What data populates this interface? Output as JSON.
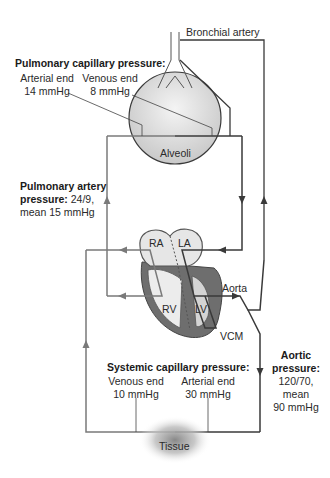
{
  "labels": {
    "bronchial_artery": "Bronchial artery",
    "pulmonary_capillary": {
      "title": "Pulmonary capillary pressure:",
      "arterial_end": "Arterial end",
      "arterial_value": "14 mmHg",
      "venous_end": "Venous end",
      "venous_value": "8 mmHg"
    },
    "alveoli": "Alveoli",
    "pulmonary_artery": {
      "title_line1": "Pulmonary artery",
      "title_line2_bold": "pressure:",
      "title_line2_rest": " 24/9,",
      "line3": "mean 15 mmHg"
    },
    "heart": {
      "ra": "RA",
      "la": "LA",
      "rv": "RV",
      "lv": "LV",
      "aorta": "Aorta",
      "vcm": "VCM"
    },
    "aortic": {
      "line1": "Aortic",
      "line2": "pressure:",
      "line3": "120/70,",
      "line4": "mean",
      "line5": "90 mmHg"
    },
    "systemic_capillary": {
      "title": "Systemic capillary pressure:",
      "venous_end": "Venous end",
      "venous_value": "10 mmHg",
      "arterial_end": "Arterial end",
      "arterial_value": "30 mmHg"
    },
    "tissue": "Tissue"
  },
  "colors": {
    "venous_line": "#7a7a7a",
    "arterial_line": "#3a3a3a",
    "myocardium": "#6e6e6e",
    "chamber_fill": "#e6e6e6"
  }
}
